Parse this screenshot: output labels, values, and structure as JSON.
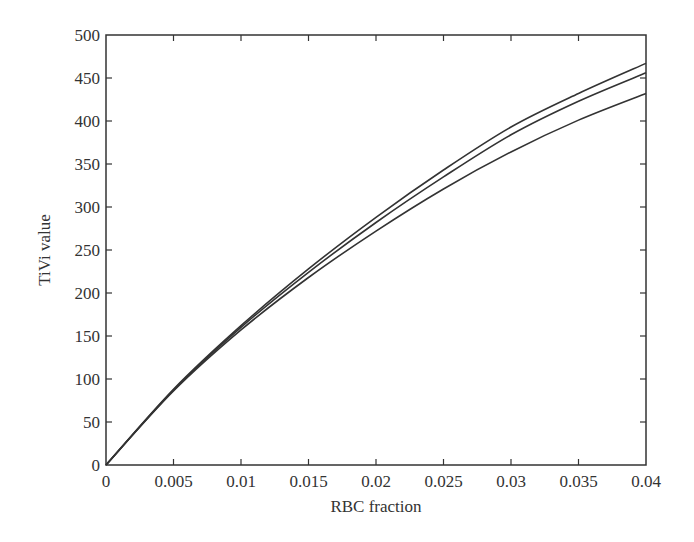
{
  "chart_data": {
    "type": "line",
    "title": "",
    "xlabel": "RBC fraction",
    "ylabel": "TiVi value",
    "xlim": [
      0,
      0.04
    ],
    "ylim": [
      0,
      500
    ],
    "grid": false,
    "legend": null,
    "x_ticks": [
      "0",
      "0.005",
      "0.01",
      "0.015",
      "0.02",
      "0.025",
      "0.03",
      "0.035",
      "0.04"
    ],
    "y_ticks": [
      "0",
      "50",
      "100",
      "150",
      "200",
      "250",
      "300",
      "350",
      "400",
      "450",
      "500"
    ],
    "x": [
      0,
      0.005,
      0.01,
      0.015,
      0.02,
      0.025,
      0.03,
      0.035,
      0.04
    ],
    "series": [
      {
        "name": "curve-1",
        "values": [
          0,
          88,
          162,
          228,
          288,
          343,
          393,
          432,
          467
        ]
      },
      {
        "name": "curve-2",
        "values": [
          0,
          87,
          160,
          224,
          282,
          335,
          384,
          423,
          456
        ]
      },
      {
        "name": "curve-3",
        "values": [
          0,
          86,
          157,
          218,
          272,
          321,
          364,
          401,
          432
        ]
      }
    ],
    "line_color": "#333333"
  }
}
